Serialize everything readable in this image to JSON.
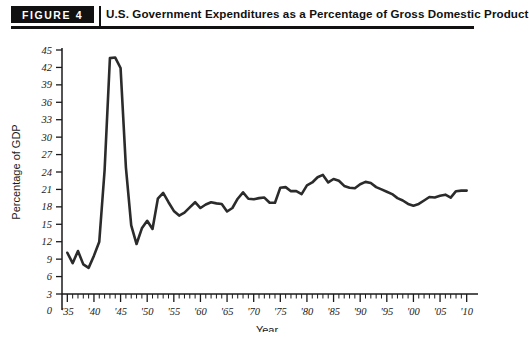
{
  "header": {
    "badge_label": "FIGURE 4",
    "title": "U.S. Government Expenditures as a Percentage of Gross Domestic Product"
  },
  "colors": {
    "line": "#2b2b2b",
    "axis": "#1a1a1a",
    "badge_bg": "#111111",
    "badge_text": "#ffffff",
    "background": "#ffffff"
  },
  "chart_data": {
    "type": "line",
    "title": "U.S. Government Expenditures as a Percentage of Gross Domestic Product",
    "xlabel": "Year",
    "ylabel": "Percentage of GDP",
    "xlim": [
      1934,
      2011
    ],
    "ylim": [
      0,
      45
    ],
    "grid": false,
    "legend": null,
    "y_ticks": [
      0,
      3,
      6,
      9,
      12,
      15,
      18,
      21,
      24,
      27,
      30,
      33,
      36,
      39,
      42,
      45
    ],
    "y_tick_labels": [
      "0",
      "3",
      "6",
      "9",
      "12",
      "15",
      "18",
      "21",
      "24",
      "27",
      "30",
      "33",
      "36",
      "39",
      "42",
      "45"
    ],
    "x_ticks": [
      1935,
      1940,
      1945,
      1950,
      1955,
      1960,
      1965,
      1970,
      1975,
      1980,
      1985,
      1990,
      1995,
      2000,
      2005,
      2010
    ],
    "x_tick_labels": [
      "'35",
      "'40",
      "'45",
      "'50",
      "'55",
      "'60",
      "'65",
      "'70",
      "'75",
      "'80",
      "'85",
      "'90",
      "'95",
      "'00",
      "'05",
      "'10"
    ],
    "x_minor_tick_interval": 1,
    "axis_break_below": 3,
    "series": [
      {
        "name": "U.S. Government Expenditures (% of GDP)",
        "x": [
          1935,
          1936,
          1937,
          1938,
          1939,
          1940,
          1941,
          1942,
          1943,
          1944,
          1945,
          1946,
          1947,
          1948,
          1949,
          1950,
          1951,
          1952,
          1953,
          1954,
          1955,
          1956,
          1957,
          1958,
          1959,
          1960,
          1961,
          1962,
          1963,
          1964,
          1965,
          1966,
          1967,
          1968,
          1969,
          1970,
          1971,
          1972,
          1973,
          1974,
          1975,
          1976,
          1977,
          1978,
          1979,
          1980,
          1981,
          1982,
          1983,
          1984,
          1985,
          1986,
          1987,
          1988,
          1989,
          1990,
          1991,
          1992,
          1993,
          1994,
          1995,
          1996,
          1997,
          1998,
          1999,
          2000,
          2001,
          2002,
          2003,
          2004,
          2005,
          2006,
          2007,
          2008,
          2009,
          2010
        ],
        "values": [
          10.1,
          8.3,
          10.4,
          8.1,
          7.5,
          9.6,
          12.0,
          24.3,
          43.6,
          43.7,
          41.9,
          24.8,
          14.8,
          11.6,
          14.3,
          15.6,
          14.2,
          19.4,
          20.4,
          18.8,
          17.3,
          16.5,
          17.0,
          17.9,
          18.8,
          17.8,
          18.4,
          18.8,
          18.6,
          18.5,
          17.2,
          17.8,
          19.4,
          20.5,
          19.4,
          19.3,
          19.5,
          19.6,
          18.7,
          18.7,
          21.3,
          21.4,
          20.7,
          20.7,
          20.2,
          21.7,
          22.2,
          23.1,
          23.5,
          22.2,
          22.8,
          22.5,
          21.6,
          21.3,
          21.2,
          21.9,
          22.3,
          22.1,
          21.4,
          21.0,
          20.6,
          20.2,
          19.5,
          19.1,
          18.5,
          18.2,
          18.5,
          19.1,
          19.7,
          19.6,
          19.9,
          20.1,
          19.6,
          20.7,
          20.8,
          20.8
        ]
      }
    ],
    "annotations": []
  }
}
